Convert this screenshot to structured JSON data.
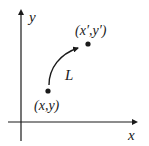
{
  "diagram": {
    "type": "coordinate-transformation",
    "axes": {
      "x_label": "x",
      "y_label": "y"
    },
    "points": [
      {
        "id": "start",
        "label": "(x,y)"
      },
      {
        "id": "end",
        "label": "(x′,y′)"
      }
    ],
    "path": {
      "label": "L",
      "from": "start",
      "to": "end",
      "arrow": true
    },
    "colors": {
      "ink": "#1a1a1a",
      "background": "#ffffff"
    }
  }
}
